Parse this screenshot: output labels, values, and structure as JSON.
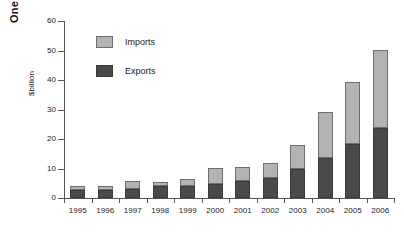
{
  "page_marker": "One",
  "chart_data": {
    "type": "bar",
    "subtype": "stacked-vertical",
    "title": "",
    "xlabel": "",
    "ylabel": "$billion",
    "ylim": [
      0,
      60
    ],
    "ytick_values": [
      0,
      10,
      20,
      30,
      40,
      50,
      60
    ],
    "ytick_labels": [
      "0",
      "10",
      "20",
      "30",
      "40",
      "50",
      "60"
    ],
    "grid": false,
    "legend_position": "inside-top-left",
    "categories": [
      "1995",
      "1996",
      "1997",
      "1998",
      "1999",
      "2000",
      "2001",
      "2002",
      "2003",
      "2004",
      "2005",
      "2006"
    ],
    "series": [
      {
        "name": "Exports",
        "color": "#4a4a4a",
        "stack_order": 0,
        "values": [
          2.7,
          2.7,
          3.2,
          4.0,
          4.0,
          4.8,
          5.8,
          6.7,
          9.8,
          13.4,
          18.2,
          23.6
        ]
      },
      {
        "name": "Imports",
        "color": "#b3b3b3",
        "stack_order": 1,
        "values": [
          1.3,
          1.3,
          2.5,
          1.4,
          2.3,
          5.5,
          4.6,
          5.3,
          8.3,
          15.6,
          21.1,
          26.5
        ]
      }
    ],
    "totals": [
      4.0,
      4.0,
      5.7,
      5.4,
      6.3,
      10.3,
      10.4,
      12.0,
      18.1,
      29.0,
      39.3,
      50.1
    ]
  }
}
